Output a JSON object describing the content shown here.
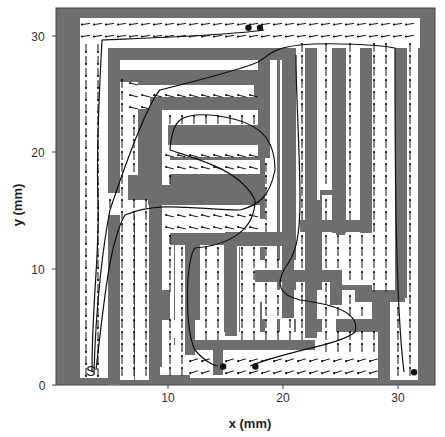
{
  "chart_data": {
    "type": "vector_field_maze",
    "title": "",
    "xlabel": "x (mm)",
    "ylabel": "y (mm)",
    "xlim": [
      0,
      33
    ],
    "ylim": [
      0,
      33
    ],
    "xticks": [
      10,
      20,
      30
    ],
    "yticks": [
      0,
      10,
      20,
      30
    ],
    "grid": false,
    "legend": null,
    "start_marker_label": "S",
    "wall_color": "#6e6e6e",
    "corridor_color": "#ffffff",
    "arrow_color": "#111111",
    "path_color": "#111111",
    "end_points_mm": [
      [
        17.0,
        30.8
      ],
      [
        18.0,
        30.8
      ],
      [
        14.8,
        1.6
      ],
      [
        17.6,
        1.6
      ],
      [
        31.4,
        1.1
      ]
    ],
    "trajectories_description": "Several trajectories start at S (~3.5, 1.5) and travel up the leftmost corridor to the top, then descend through the maze to endpoints marked with dots."
  },
  "axes": {
    "x_tick_labels": [
      "10",
      "20",
      "30"
    ],
    "y_tick_labels": [
      "0",
      "10",
      "20",
      "30"
    ],
    "x_label": "x (mm)",
    "y_label": "y (mm)"
  }
}
